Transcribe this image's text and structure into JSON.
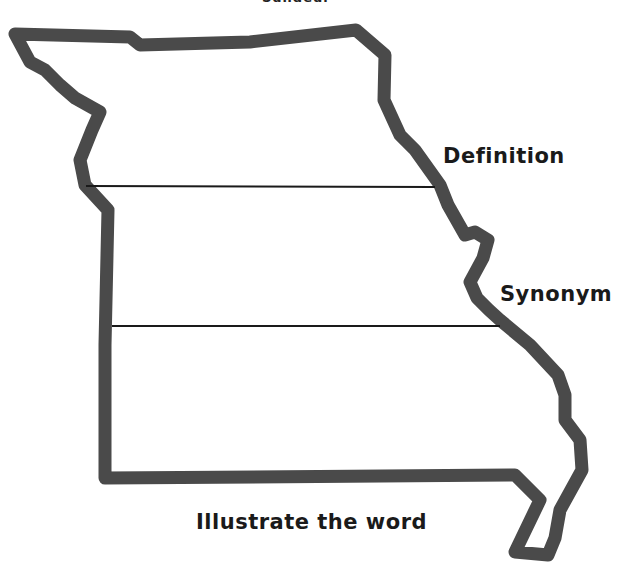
{
  "worksheet": {
    "top_caption": "Sundeur",
    "shape": "Missouri state outline",
    "outline_color": "#4a4a4a",
    "line_color": "#1a1a1a",
    "sections": [
      {
        "label": "Definition"
      },
      {
        "label": "Synonym"
      },
      {
        "label": "Illustrate the word"
      }
    ]
  }
}
